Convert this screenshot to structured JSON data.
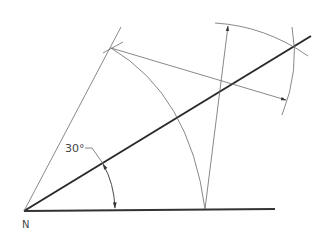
{
  "diagram": {
    "angle_label": "30°",
    "vertex_label": "N",
    "colors": {
      "thin_line": "#6a6a6a",
      "thick_line": "#2a2a2a",
      "text": "#444444",
      "background": "#ffffff"
    }
  }
}
